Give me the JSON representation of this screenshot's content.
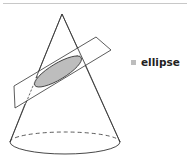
{
  "figure": {
    "colors": {
      "stroke": "#333333",
      "ellipse_fill": "#bdbdbd",
      "rule": "#c8c8c8",
      "plane_fill": "#ffffff"
    }
  },
  "legend": {
    "items": [
      {
        "label": "ellipse",
        "color": "#bdbdbd"
      }
    ]
  }
}
